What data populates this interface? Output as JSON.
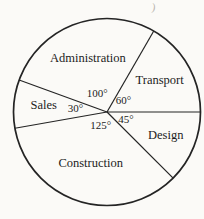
{
  "chart_data": {
    "type": "pie",
    "title": "",
    "unit": "degrees",
    "direction": "counterclockwise",
    "start_angle_deg": 0,
    "total_deg": 360,
    "fill": "none",
    "stroke_color": "#242424",
    "text_color": "#1c1c1c",
    "background_color": "#fbfaf7",
    "legend": "none",
    "sectors": [
      {
        "label": "Transport",
        "angle_deg": 60,
        "angle_label": "60°"
      },
      {
        "label": "Administration",
        "angle_deg": 100,
        "angle_label": "100°"
      },
      {
        "label": "Sales",
        "angle_deg": 30,
        "angle_label": "30°"
      },
      {
        "label": "Construction",
        "angle_deg": 125,
        "angle_label": "125°"
      },
      {
        "label": "Design",
        "angle_deg": 45,
        "angle_label": "45°"
      }
    ]
  },
  "artifacts": {
    "top_right_mark": ")"
  }
}
